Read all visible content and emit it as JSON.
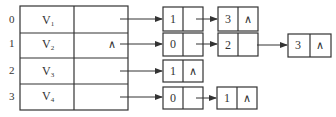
{
  "diagram": {
    "type": "adjacency-list",
    "stroke_color": "#333333",
    "vertex_table": [
      {
        "index": "0",
        "vertex": "V",
        "sub": "1",
        "first": "arrow"
      },
      {
        "index": "1",
        "vertex": "V",
        "sub": "2",
        "first": "∧"
      },
      {
        "index": "2",
        "vertex": "V",
        "sub": "3",
        "first": "arrow"
      },
      {
        "index": "3",
        "vertex": "V",
        "sub": "4",
        "first": "arrow"
      }
    ],
    "edge_lists": [
      [
        {
          "adj": "1",
          "next": "arrow"
        },
        {
          "adj": "3",
          "next": "∧"
        }
      ],
      [
        {
          "adj": "0",
          "next": "arrow"
        },
        {
          "adj": "2",
          "next": "arrow"
        },
        {
          "adj": "3",
          "next": "∧"
        }
      ],
      [
        {
          "adj": "1",
          "next": "∧"
        }
      ],
      [
        {
          "adj": "0",
          "next": "arrow"
        },
        {
          "adj": "1",
          "next": "∧"
        }
      ]
    ]
  }
}
